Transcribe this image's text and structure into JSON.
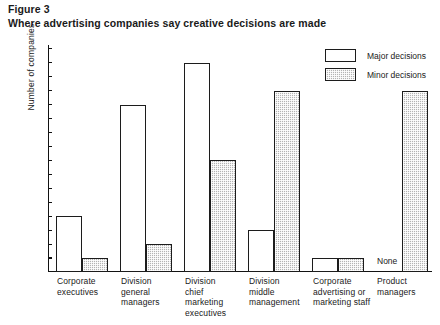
{
  "figure": {
    "number": "Figure 3",
    "title": "Where advertising companies say creative decisions are made"
  },
  "legend": {
    "major_label": "Major decisions",
    "minor_label": "Minor decisions"
  },
  "chart_data": {
    "type": "bar",
    "title": "Where advertising companies say creative decisions are made",
    "xlabel": "",
    "ylabel": "Number of companies",
    "ylim": [
      0,
      16.5
    ],
    "yticks": [
      1,
      2,
      3,
      4,
      5,
      6,
      7,
      8,
      9,
      10,
      11,
      12,
      13,
      14,
      15,
      16
    ],
    "ytick_labels": [
      "1",
      "2",
      "3",
      "4",
      "5",
      "6",
      "7",
      "8",
      "9",
      "10",
      "11",
      "12",
      "13",
      "14",
      "15",
      "16"
    ],
    "grid": false,
    "legend_position": "top-right",
    "categories": [
      "Corporate executives",
      "Division general managers",
      "Division chief marketing executives",
      "Division middle management",
      "Corporate advertising or marketing staff",
      "Product managers"
    ],
    "category_lines": [
      [
        "Corporate",
        "executives"
      ],
      [
        "Division",
        "general",
        "managers"
      ],
      [
        "Division",
        "chief",
        "marketing",
        "executives"
      ],
      [
        "Division",
        "middle",
        "management"
      ],
      [
        "Corporate",
        "advertising or",
        "marketing staff"
      ],
      [
        "Product",
        "managers"
      ]
    ],
    "series": [
      {
        "name": "Major decisions",
        "values": [
          4,
          12,
          15,
          3,
          1,
          0
        ],
        "annotations": [
          "",
          "",
          "",
          "",
          "",
          "None"
        ]
      },
      {
        "name": "Minor decisions",
        "values": [
          1,
          2,
          8,
          13,
          1,
          13
        ],
        "annotations": [
          "",
          "",
          "",
          "",
          "",
          ""
        ]
      }
    ]
  }
}
